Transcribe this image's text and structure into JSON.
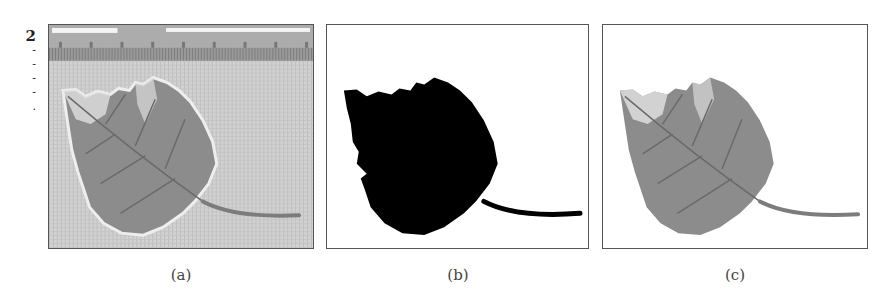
{
  "figure": {
    "margin_text": {
      "number": "2",
      "fragments": [
        "-",
        "-",
        "-",
        "-",
        "."
      ]
    },
    "panels": [
      {
        "id": "a",
        "label": "(a)",
        "description": "Original photograph of leaf on textured background with ruler at top"
      },
      {
        "id": "b",
        "label": "(b)",
        "description": "Binary segmentation mask of leaf (black on white)"
      },
      {
        "id": "c",
        "label": "(c)",
        "description": "Segmented leaf on white background"
      }
    ],
    "colors": {
      "background_texture": "#cfcfcf",
      "ruler": "#a9a9a9",
      "leaf": "#8a8a8a",
      "leaf_dark": "#6e6e6e",
      "leaf_light": "#e6e6e6",
      "mask": "#000000",
      "border": "#555555"
    }
  }
}
